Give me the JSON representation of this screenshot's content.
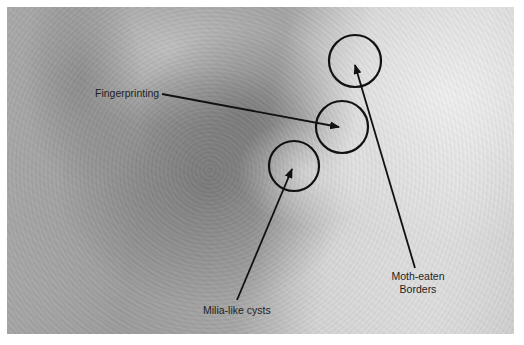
{
  "figure": {
    "annotations": [
      {
        "id": "fingerprinting",
        "label": "Fingerprinting",
        "circle": {
          "cx": 342,
          "cy": 127,
          "r": 26
        },
        "arrow_from": [
          162,
          94
        ],
        "arrow_to": [
          339,
          127
        ]
      },
      {
        "id": "milia-like-cysts",
        "label": "Milia-like cysts",
        "circle": {
          "cx": 294,
          "cy": 166,
          "r": 25
        },
        "arrow_from": [
          237,
          300
        ],
        "arrow_to": [
          292,
          168
        ]
      },
      {
        "id": "moth-eaten-borders",
        "label_line1": "Moth-eaten",
        "label_line2": "Borders",
        "circle": {
          "cx": 355,
          "cy": 61,
          "r": 26
        },
        "arrow_from": [
          415,
          268
        ],
        "arrow_to": [
          355,
          64
        ]
      }
    ],
    "colors": {
      "annotation_stroke": "#111111",
      "label_text": "#1e1e1e",
      "border": "#ffffff"
    }
  }
}
